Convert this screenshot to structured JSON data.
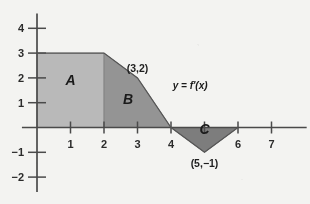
{
  "chart_data": {
    "type": "area",
    "title": "",
    "xlabel": "",
    "ylabel": "",
    "xlim": [
      -0.45,
      8.05
    ],
    "ylim": [
      -2.6,
      4.6
    ],
    "grid": false,
    "legend": "none",
    "curve_label": "y = f'(x)",
    "x_ticks": [
      {
        "value": 1,
        "label": "1"
      },
      {
        "value": 2,
        "label": "2"
      },
      {
        "value": 3,
        "label": "3"
      },
      {
        "value": 4,
        "label": "4"
      },
      {
        "value": 5,
        "label": ""
      },
      {
        "value": 6,
        "label": "6"
      },
      {
        "value": 7,
        "label": "7"
      }
    ],
    "y_ticks": [
      {
        "value": 4,
        "label": "4"
      },
      {
        "value": 3,
        "label": "3"
      },
      {
        "value": 2,
        "label": "2"
      },
      {
        "value": 1,
        "label": "1"
      },
      {
        "value": -1,
        "label": "−1"
      },
      {
        "value": -2,
        "label": "−2"
      }
    ],
    "series": [
      {
        "name": "f'(x)",
        "points": [
          [
            0,
            3
          ],
          [
            2,
            3
          ],
          [
            3,
            2
          ],
          [
            4,
            0
          ],
          [
            5,
            -1
          ],
          [
            6,
            0
          ]
        ]
      }
    ],
    "regions": [
      {
        "name": "A",
        "label": "A",
        "label_at": [
          1.0,
          1.7
        ],
        "fill": "#b9b9b9",
        "vertices": [
          [
            0,
            0
          ],
          [
            0,
            3
          ],
          [
            2,
            3
          ],
          [
            2,
            0
          ]
        ]
      },
      {
        "name": "B",
        "label": "B",
        "label_at": [
          2.72,
          0.95
        ],
        "fill": "#949494",
        "vertices": [
          [
            2,
            0
          ],
          [
            2,
            3
          ],
          [
            3,
            2
          ],
          [
            4,
            0
          ]
        ]
      },
      {
        "name": "C",
        "label": "C",
        "label_at": [
          5.0,
          -0.28
        ],
        "fill": "#7d7d7d",
        "vertices": [
          [
            4,
            0
          ],
          [
            5,
            -1
          ],
          [
            6,
            0
          ]
        ]
      }
    ],
    "point_labels": [
      {
        "text": "(3,2)",
        "at": [
          3,
          2
        ],
        "placement": "above"
      },
      {
        "text": "(5,−1)",
        "at": [
          5,
          -1
        ],
        "placement": "below"
      }
    ],
    "curve_label_at": [
      4.05,
      1.55
    ],
    "colors": {
      "background": "#f3f3f1",
      "axis": "#4a4a4a",
      "region_a": "#b9b9b9",
      "region_b": "#949494",
      "region_c": "#7d7d7d",
      "text": "#1f1f1f"
    }
  }
}
